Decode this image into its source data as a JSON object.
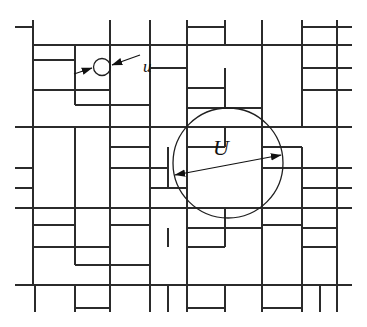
{
  "figure": {
    "name": "random-rectangular-tiling-with-scale-circles",
    "background_color": "#ffffff",
    "line_color": "#2b2b2b",
    "labels": {
      "small_scale": "u",
      "large_scale": "U"
    },
    "small_circle": {
      "label": "u",
      "cx": 102,
      "cy": 67,
      "r": 8.5,
      "arrow_left_tail_x": 74,
      "arrow_left_tail_y": 74,
      "arrow_left_head_x": 92,
      "arrow_left_head_y": 68,
      "arrow_right_tail_x": 140,
      "arrow_right_tail_y": 55,
      "arrow_right_head_x": 112,
      "arrow_right_head_y": 65,
      "label_x": 143,
      "label_y": 72
    },
    "large_circle": {
      "label": "U",
      "cx": 228,
      "cy": 163,
      "r": 55,
      "arrow_left_head_x": 175,
      "arrow_left_head_y": 175,
      "arrow_right_head_x": 281,
      "arrow_right_head_y": 155,
      "label_x": 213,
      "label_y": 155
    },
    "frame": {
      "left": 33,
      "right": 337,
      "top": 45,
      "bottom": 285
    },
    "horizontal_rules": [
      {
        "x1": 15,
        "y1": 27,
        "x2": 33,
        "y2": 27
      },
      {
        "x1": 33,
        "y1": 45,
        "x2": 352,
        "y2": 45
      },
      {
        "x1": 15,
        "y1": 127,
        "x2": 352,
        "y2": 127
      },
      {
        "x1": 15,
        "y1": 168,
        "x2": 33,
        "y2": 168
      },
      {
        "x1": 15,
        "y1": 188,
        "x2": 33,
        "y2": 188
      },
      {
        "x1": 15,
        "y1": 208,
        "x2": 352,
        "y2": 208
      },
      {
        "x1": 15,
        "y1": 285,
        "x2": 352,
        "y2": 285
      },
      {
        "x1": 337,
        "y1": 27,
        "x2": 352,
        "y2": 27
      },
      {
        "x1": 337,
        "y1": 68,
        "x2": 352,
        "y2": 68
      },
      {
        "x1": 337,
        "y1": 90,
        "x2": 352,
        "y2": 90
      },
      {
        "x1": 337,
        "y1": 168,
        "x2": 352,
        "y2": 168
      },
      {
        "x1": 337,
        "y1": 188,
        "x2": 352,
        "y2": 188
      },
      {
        "x1": 33,
        "y1": 60,
        "x2": 75,
        "y2": 60
      },
      {
        "x1": 33,
        "y1": 90,
        "x2": 110,
        "y2": 90
      },
      {
        "x1": 75,
        "y1": 105,
        "x2": 150,
        "y2": 105
      },
      {
        "x1": 150,
        "y1": 68,
        "x2": 187,
        "y2": 68
      },
      {
        "x1": 187,
        "y1": 27,
        "x2": 225,
        "y2": 27
      },
      {
        "x1": 302,
        "y1": 27,
        "x2": 337,
        "y2": 27
      },
      {
        "x1": 187,
        "y1": 88,
        "x2": 225,
        "y2": 88
      },
      {
        "x1": 187,
        "y1": 108,
        "x2": 262,
        "y2": 108
      },
      {
        "x1": 302,
        "y1": 68,
        "x2": 337,
        "y2": 68
      },
      {
        "x1": 302,
        "y1": 90,
        "x2": 337,
        "y2": 90
      },
      {
        "x1": 110,
        "y1": 147,
        "x2": 150,
        "y2": 147
      },
      {
        "x1": 110,
        "y1": 168,
        "x2": 168,
        "y2": 168
      },
      {
        "x1": 150,
        "y1": 188,
        "x2": 187,
        "y2": 188
      },
      {
        "x1": 187,
        "y1": 147,
        "x2": 225,
        "y2": 147
      },
      {
        "x1": 262,
        "y1": 147,
        "x2": 302,
        "y2": 147
      },
      {
        "x1": 262,
        "y1": 168,
        "x2": 337,
        "y2": 168
      },
      {
        "x1": 302,
        "y1": 188,
        "x2": 337,
        "y2": 188
      },
      {
        "x1": 33,
        "y1": 225,
        "x2": 75,
        "y2": 225
      },
      {
        "x1": 33,
        "y1": 247,
        "x2": 110,
        "y2": 247
      },
      {
        "x1": 75,
        "y1": 265,
        "x2": 150,
        "y2": 265
      },
      {
        "x1": 110,
        "y1": 225,
        "x2": 150,
        "y2": 225
      },
      {
        "x1": 187,
        "y1": 228,
        "x2": 262,
        "y2": 228
      },
      {
        "x1": 187,
        "y1": 247,
        "x2": 225,
        "y2": 247
      },
      {
        "x1": 262,
        "y1": 225,
        "x2": 302,
        "y2": 225
      },
      {
        "x1": 302,
        "y1": 228,
        "x2": 337,
        "y2": 228
      },
      {
        "x1": 302,
        "y1": 247,
        "x2": 337,
        "y2": 247
      },
      {
        "x1": 187,
        "y1": 308,
        "x2": 225,
        "y2": 308
      },
      {
        "x1": 262,
        "y1": 308,
        "x2": 302,
        "y2": 308
      },
      {
        "x1": 75,
        "y1": 308,
        "x2": 110,
        "y2": 308
      }
    ],
    "vertical_rules": [
      {
        "x1": 33,
        "y1": 20,
        "x2": 33,
        "y2": 285
      },
      {
        "x1": 337,
        "y1": 20,
        "x2": 337,
        "y2": 312
      },
      {
        "x1": 110,
        "y1": 20,
        "x2": 110,
        "y2": 45
      },
      {
        "x1": 150,
        "y1": 20,
        "x2": 150,
        "y2": 45
      },
      {
        "x1": 187,
        "y1": 20,
        "x2": 187,
        "y2": 45
      },
      {
        "x1": 225,
        "y1": 20,
        "x2": 225,
        "y2": 45
      },
      {
        "x1": 262,
        "y1": 20,
        "x2": 262,
        "y2": 45
      },
      {
        "x1": 302,
        "y1": 20,
        "x2": 302,
        "y2": 45
      },
      {
        "x1": 75,
        "y1": 45,
        "x2": 75,
        "y2": 105
      },
      {
        "x1": 110,
        "y1": 45,
        "x2": 110,
        "y2": 127
      },
      {
        "x1": 150,
        "y1": 45,
        "x2": 150,
        "y2": 127
      },
      {
        "x1": 187,
        "y1": 45,
        "x2": 187,
        "y2": 127
      },
      {
        "x1": 225,
        "y1": 68,
        "x2": 225,
        "y2": 108
      },
      {
        "x1": 262,
        "y1": 45,
        "x2": 262,
        "y2": 127
      },
      {
        "x1": 302,
        "y1": 45,
        "x2": 302,
        "y2": 127
      },
      {
        "x1": 75,
        "y1": 127,
        "x2": 75,
        "y2": 208
      },
      {
        "x1": 110,
        "y1": 127,
        "x2": 110,
        "y2": 208
      },
      {
        "x1": 150,
        "y1": 127,
        "x2": 150,
        "y2": 208
      },
      {
        "x1": 168,
        "y1": 147,
        "x2": 168,
        "y2": 188
      },
      {
        "x1": 187,
        "y1": 127,
        "x2": 187,
        "y2": 208
      },
      {
        "x1": 225,
        "y1": 127,
        "x2": 225,
        "y2": 147
      },
      {
        "x1": 262,
        "y1": 127,
        "x2": 262,
        "y2": 208
      },
      {
        "x1": 302,
        "y1": 147,
        "x2": 302,
        "y2": 208
      },
      {
        "x1": 75,
        "y1": 208,
        "x2": 75,
        "y2": 265
      },
      {
        "x1": 110,
        "y1": 208,
        "x2": 110,
        "y2": 285
      },
      {
        "x1": 150,
        "y1": 208,
        "x2": 150,
        "y2": 285
      },
      {
        "x1": 168,
        "y1": 228,
        "x2": 168,
        "y2": 247
      },
      {
        "x1": 187,
        "y1": 208,
        "x2": 187,
        "y2": 285
      },
      {
        "x1": 225,
        "y1": 208,
        "x2": 225,
        "y2": 247
      },
      {
        "x1": 262,
        "y1": 208,
        "x2": 262,
        "y2": 285
      },
      {
        "x1": 302,
        "y1": 208,
        "x2": 302,
        "y2": 285
      },
      {
        "x1": 35,
        "y1": 285,
        "x2": 35,
        "y2": 312
      },
      {
        "x1": 75,
        "y1": 285,
        "x2": 75,
        "y2": 312
      },
      {
        "x1": 110,
        "y1": 285,
        "x2": 110,
        "y2": 312
      },
      {
        "x1": 150,
        "y1": 285,
        "x2": 150,
        "y2": 312
      },
      {
        "x1": 168,
        "y1": 285,
        "x2": 168,
        "y2": 312
      },
      {
        "x1": 187,
        "y1": 285,
        "x2": 187,
        "y2": 312
      },
      {
        "x1": 225,
        "y1": 285,
        "x2": 225,
        "y2": 312
      },
      {
        "x1": 262,
        "y1": 285,
        "x2": 262,
        "y2": 312
      },
      {
        "x1": 302,
        "y1": 285,
        "x2": 302,
        "y2": 312
      },
      {
        "x1": 320,
        "y1": 285,
        "x2": 320,
        "y2": 312
      }
    ]
  }
}
